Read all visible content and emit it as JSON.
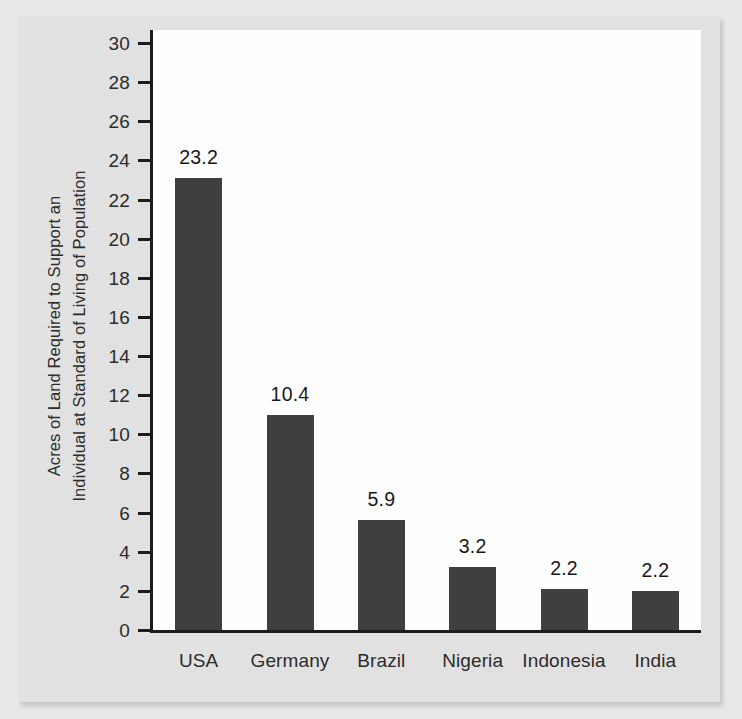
{
  "figure": {
    "background_color": "#e3e3e3",
    "plot_background_color": "#fefefe",
    "bar_color": "#3f3f3f",
    "axis_color": "#1c1c1c",
    "y_axis_title_line1": "Acres of Land Required to Support an",
    "y_axis_title_line2": "Individual at Standard of Living of Population"
  },
  "chart_data": {
    "type": "bar",
    "title": "",
    "xlabel": "",
    "ylabel": "Acres of Land Required to Support an Individual at Standard of Living of Population",
    "categories": [
      "USA",
      "Germany",
      "Brazil",
      "Nigeria",
      "Indonesia",
      "India"
    ],
    "values": [
      23.2,
      10.4,
      5.9,
      3.2,
      2.2,
      2.2
    ],
    "value_labels": [
      "23.2",
      "10.4",
      "5.9",
      "3.2",
      "2.2",
      "2.2"
    ],
    "bar_drawn_heights": [
      23.1,
      11.0,
      5.6,
      3.2,
      2.1,
      2.0
    ],
    "ylim": [
      0,
      31
    ],
    "yticks": [
      0,
      2,
      4,
      6,
      8,
      10,
      12,
      14,
      16,
      18,
      20,
      22,
      24,
      26,
      28,
      30
    ],
    "ytick_labels": [
      "0",
      "2",
      "4",
      "6",
      "8",
      "10",
      "12",
      "14",
      "16",
      "18",
      "20",
      "22",
      "24",
      "26",
      "28",
      "30"
    ],
    "grid": false,
    "legend": null,
    "legend_position": "none",
    "series": [
      {
        "name": "Acres of land per individual",
        "values": [
          23.2,
          10.4,
          5.9,
          3.2,
          2.2,
          2.2
        ]
      }
    ]
  }
}
